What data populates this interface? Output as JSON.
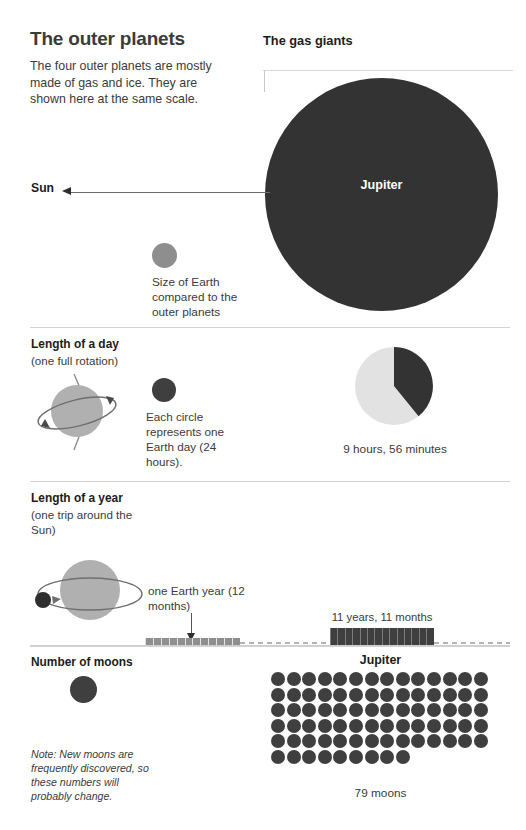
{
  "header": {
    "title": "The outer planets",
    "intro": "The four outer planets are mostly made of gas and ice. They are shown here at the same scale.",
    "right_title": "The gas giants"
  },
  "scale_section": {
    "sun_label": "Sun",
    "planet_label": "Jupiter",
    "earth_key_caption": "Size of Earth compared to the outer planets"
  },
  "day_section": {
    "heading": "Length of a day",
    "subheading": "(one full rotation)",
    "key_caption": "Each circle represents one Earth day (24 hours).",
    "value_caption": "9 hours, 56 minutes"
  },
  "year_section": {
    "heading": "Length of a year",
    "subheading": "(one trip around the Sun)",
    "key_caption": "one Earth year (12 months)",
    "value_caption": "11 years, 11 months"
  },
  "moons_section": {
    "heading": "Number of moons",
    "planet_label": "Jupiter",
    "count_caption": "79 moons",
    "note": "Note: New moons are frequently discovered, so these numbers will probably change."
  },
  "colors": {
    "planet_dark": "#333333",
    "dot_dark": "#3f3f3f",
    "planet_gray": "#8e8e8e",
    "pie_light": "#e2e2e2",
    "text": "#3b3b3b",
    "rule": "#d2d2d2"
  },
  "chart_data": [
    {
      "type": "pie",
      "title": "9 hours, 56 minutes",
      "labels": [
        "Jupiter day length",
        "Remainder of 24-hour Earth day"
      ],
      "values": [
        9.933,
        14.067
      ],
      "units": "hours",
      "total": 24,
      "colors": [
        "#333333",
        "#e2e2e2"
      ],
      "legend": "none"
    },
    {
      "type": "bar",
      "title": "Length of a year",
      "orientation": "horizontal",
      "categories": [
        "one Earth year (12 months)",
        "11 years, 11 months"
      ],
      "series": [
        {
          "name": "Jupiter",
          "values": [
            1,
            11.917
          ]
        }
      ],
      "units": "Earth years",
      "xlabel": "",
      "ylabel": "",
      "grid": false
    },
    {
      "type": "table",
      "title": "Number of moons",
      "categories": [
        "Jupiter"
      ],
      "values": [
        79
      ],
      "dot_grid": {
        "columns": 14,
        "rows": 6,
        "total": 79,
        "last_row": 9
      },
      "units": "moons"
    }
  ]
}
